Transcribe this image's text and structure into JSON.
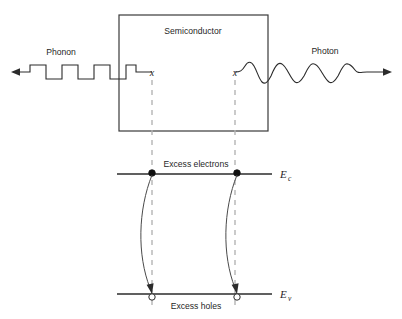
{
  "figure": {
    "type": "physics-band-diagram"
  },
  "box": {
    "label": "Semiconductor"
  },
  "waves": {
    "phonon": {
      "label": "Phonon",
      "waveform": "square",
      "cycles": 3,
      "direction": "left"
    },
    "photon": {
      "label": "Photon",
      "waveform": "sine",
      "cycles": 4,
      "direction": "right"
    }
  },
  "markers": {
    "left_x": "x",
    "right_x": "x"
  },
  "bands": {
    "conduction": {
      "symbol": "E",
      "subscript": "c",
      "carrier_label": "Excess electrons",
      "carrier_type": "electron"
    },
    "valence": {
      "symbol": "E",
      "subscript": "v",
      "carrier_label": "Excess holes",
      "carrier_type": "hole"
    }
  },
  "transitions": [
    {
      "name": "left-recombination",
      "from": "conduction",
      "to": "valence"
    },
    {
      "name": "right-recombination",
      "from": "conduction",
      "to": "valence"
    }
  ],
  "colors": {
    "line": "#2b2b2b",
    "dashed": "#b4b4b4",
    "text": "#1f1f1f",
    "background": "#ffffff"
  }
}
